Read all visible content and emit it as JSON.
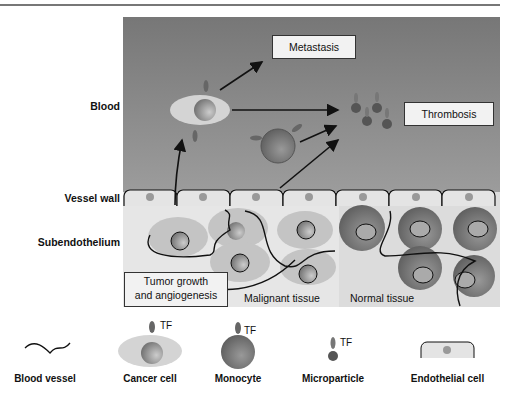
{
  "side_labels": {
    "blood": "Blood",
    "vessel_wall": "Vessel wall",
    "subendothelium": "Subendothelium"
  },
  "boxes": {
    "metastasis": "Metastasis",
    "thrombosis": "Thrombosis",
    "tumor_line1": "Tumor growth",
    "tumor_line2": "and angiogenesis"
  },
  "tissue_labels": {
    "malignant": "Malignant tissue",
    "normal": "Normal tissue"
  },
  "legend": [
    {
      "label": "Blood vessel",
      "icon": "wavy-line-icon"
    },
    {
      "label": "Cancer cell",
      "icon": "cancer-cell-icon",
      "tf": "TF"
    },
    {
      "label": "Monocyte",
      "icon": "monocyte-icon",
      "tf": "TF"
    },
    {
      "label": "Microparticle",
      "icon": "microparticle-icon",
      "tf": "TF"
    },
    {
      "label": "Endothelial cell",
      "icon": "endothelial-cell-icon"
    }
  ],
  "colors": {
    "blood_top": "#7a7a7a",
    "blood_bottom": "#9a9a9a",
    "tissue": "#e6e6e6",
    "normal_tissue": "#dadada",
    "cancer_cell": "#cfcfcf",
    "monocyte": "#6e6e6e",
    "tf": "#6a6a6a"
  }
}
